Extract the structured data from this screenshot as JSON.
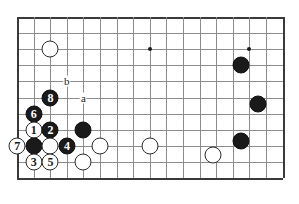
{
  "diagram": {
    "board": {
      "cols": 17,
      "rows": 11,
      "origin_x": 17,
      "origin_y": 17,
      "cell": 16.6,
      "cell_y": 16.1,
      "line_color": "#8c8c8c",
      "edge_color": "#3a3a3a",
      "background": "#ffffff"
    },
    "star_points": [
      {
        "name": "star-point-left",
        "col": 2,
        "row": 2
      },
      {
        "name": "star-point-center",
        "col": 8,
        "row": 2
      },
      {
        "name": "star-point-right",
        "col": 14,
        "row": 2
      }
    ],
    "stones": [
      {
        "name": "white-stone-top-left",
        "color": "white",
        "col": 2,
        "row": 2,
        "label": ""
      },
      {
        "name": "black-stone-right-upper",
        "color": "black",
        "col": 13.5,
        "row": 3,
        "label": ""
      },
      {
        "name": "black-stone-right-mid",
        "color": "black",
        "col": 14.5,
        "row": 5.4,
        "label": ""
      },
      {
        "name": "black-stone-right-lower",
        "color": "black",
        "col": 13.5,
        "row": 7.7,
        "label": ""
      },
      {
        "name": "white-stone-right-lower",
        "color": "white",
        "col": 11.8,
        "row": 8.6,
        "label": ""
      },
      {
        "name": "black-stone-move-8",
        "color": "black",
        "col": 2,
        "row": 5,
        "label": "8"
      },
      {
        "name": "black-stone-move-6",
        "color": "black",
        "col": 1,
        "row": 6,
        "label": "6"
      },
      {
        "name": "white-stone-move-1",
        "color": "white",
        "col": 1,
        "row": 7,
        "label": "1"
      },
      {
        "name": "black-stone-move-2",
        "color": "black",
        "col": 2,
        "row": 7,
        "label": "2"
      },
      {
        "name": "black-stone-center-right",
        "color": "black",
        "col": 4,
        "row": 7,
        "label": ""
      },
      {
        "name": "white-stone-move-7",
        "color": "white",
        "col": 0,
        "row": 8,
        "label": "7"
      },
      {
        "name": "black-stone-captured",
        "color": "black",
        "col": 1,
        "row": 8,
        "label": ""
      },
      {
        "name": "white-stone-plain-a",
        "color": "white",
        "col": 2,
        "row": 8,
        "label": ""
      },
      {
        "name": "black-stone-move-4",
        "color": "black",
        "col": 3,
        "row": 8,
        "label": "4"
      },
      {
        "name": "white-stone-plain-b",
        "color": "white",
        "col": 5,
        "row": 8,
        "label": ""
      },
      {
        "name": "white-stone-plain-c",
        "color": "white",
        "col": 8,
        "row": 8,
        "label": ""
      },
      {
        "name": "white-stone-move-3",
        "color": "white",
        "col": 1,
        "row": 9,
        "label": "3"
      },
      {
        "name": "white-stone-move-5",
        "color": "white",
        "col": 2,
        "row": 9,
        "label": "5"
      },
      {
        "name": "white-stone-plain-d",
        "color": "white",
        "col": 4,
        "row": 9,
        "label": ""
      }
    ],
    "letter_markers": [
      {
        "name": "letter-marker-b",
        "label": "b",
        "col": 3,
        "row": 4
      },
      {
        "name": "letter-marker-a",
        "label": "a",
        "col": 4,
        "row": 5
      }
    ]
  }
}
